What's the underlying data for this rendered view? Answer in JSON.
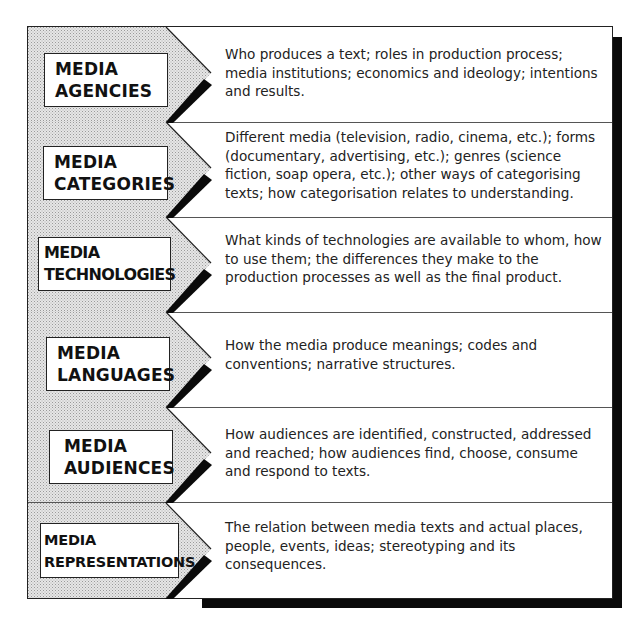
{
  "diagram": {
    "title": "",
    "rows": [
      {
        "label_line1": "MEDIA",
        "label_line2": "AGENCIES",
        "description": "Who produces a text; roles in production process; media institutions; economics and ideology; intentions and results."
      },
      {
        "label_line1": "MEDIA",
        "label_line2": "CATEGORIES",
        "description": "Different media (television, radio, cinema, etc.); forms (documentary, advertising, etc.); genres (science fiction, soap opera, etc.); other ways of categorising texts; how categorisation relates to understanding."
      },
      {
        "label_line1": "MEDIA",
        "label_line2": "TECHNOLOGIES",
        "description": "What kinds of technologies are available to whom, how to use them; the differences they make to the production processes as well as the final product."
      },
      {
        "label_line1": "MEDIA",
        "label_line2": "LANGUAGES",
        "description": "How the media produce meanings; codes and conventions; narrative structures."
      },
      {
        "label_line1": "MEDIA",
        "label_line2": "AUDIENCES",
        "description": "How audiences are identified, constructed, addressed and reached; how audiences find, choose, consume and respond to texts."
      },
      {
        "label_line1": "MEDIA",
        "label_line2": "REPRESENTATIONS",
        "description": "The relation between media texts and actual places, people, events, ideas; stereotyping and its consequences."
      }
    ]
  },
  "colors": {
    "arrow_fill": "#d9d9d9",
    "border": "#222222",
    "shadow": "#0a0a0a",
    "background": "#ffffff"
  }
}
